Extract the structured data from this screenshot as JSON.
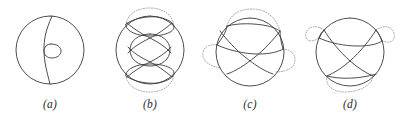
{
  "page": {
    "background_color": "#ffffff",
    "solid_stroke_color": "#3a3a3a",
    "dotted_stroke_color": "#9a9a9a"
  },
  "figures": [
    {
      "label": "(a)",
      "name": "figure-a",
      "description": "circle with a vertical meridian curve and a small loop at the center",
      "center": [
        50,
        50
      ],
      "radius": 34,
      "solid_paths": [
        "M 50 16 A 34 34 0 1 0 50 84 A 34 34 0 1 0 50 16",
        "M 52 16 C 45 32 44 40 44 50 C 44 62 47 72 50 84",
        "M 51 44 C 57 44 61 47 61 51 C 61 55 57 58 52 58 C 47 58 44 55 44 51 C 44 47 47 44 51 44"
      ],
      "dotted_paths": []
    },
    {
      "label": "(b)",
      "name": "figure-b",
      "description": "circle with two lens-shaped arcs top and bottom, a central oval, crossing arcs, and dotted outer caps top and bottom",
      "center": [
        50,
        50
      ],
      "radius": 34,
      "solid_paths": [
        "M 50 16 A 34 34 0 1 0 50 84 A 34 34 0 1 0 50 16",
        "M 26 24 C 34 18 48 16 58 17 C 68 19 74 23 74 27 C 74 32 64 36 50 36 C 36 36 27 31 26 26 Z",
        "M 26 76 C 34 82 48 84 58 83 C 68 81 74 77 74 73 C 74 68 64 64 50 64 C 36 64 27 69 26 74 Z",
        "M 50 34 C 38 34 30 41 30 50 C 30 59 38 66 50 66 C 62 66 70 59 70 50 C 70 41 62 34 50 34 Z",
        "M 27 23 C 35 30 44 35 50 38 C 58 42 66 47 71 53",
        "M 72 23 C 64 30 56 35 50 38 C 42 42 33 47 28 53",
        "M 27 77 C 35 70 44 65 50 62 C 58 58 66 53 71 47",
        "M 72 77 C 64 70 56 65 50 62 C 42 58 33 53 28 47"
      ],
      "dotted_paths": [
        "M 26 25 C 27 14 37 8 50 8 C 63 8 73 15 74 26",
        "M 26 75 C 27 86 37 92 50 92 C 63 92 73 85 74 74"
      ]
    },
    {
      "label": "(c)",
      "name": "figure-c",
      "description": "circle with three arcs crossing in the interior and three dotted outer caps at top, left and right",
      "center": [
        50,
        52
      ],
      "radius": 34,
      "solid_paths": [
        "M 50 18 A 34 34 0 1 0 50 86 A 34 34 0 1 0 50 18",
        "M 27 26 C 38 23 54 23 68 26 C 76 28 80 31 80 31",
        "M 20 31 C 26 39 36 50 45 57 C 55 65 64 71 73 74",
        "M 80 31 C 74 39 64 50 55 57 C 45 65 36 71 27 74",
        "M 17 45 C 28 50 44 54 58 54 C 70 54 78 52 83 49",
        "M 17 45 C 22 38 26 33 27 26",
        "M 83 49 C 81 42 80 36 80 31"
      ],
      "dotted_paths": [
        "M 27 26 C 30 15 39 9 52 9 C 66 9 76 17 80 31",
        "M 17 45 C 9 44 4 47 3 53 C 2 60 8 66 21 68",
        "M 83 49 C 91 50 95 54 95 60 C 95 67 88 72 75 72"
      ]
    },
    {
      "label": "(d)",
      "name": "figure-d",
      "description": "circle with three arcs crossing in the interior and three dotted outer caps at upper-left, upper-right and bottom",
      "center": [
        50,
        52
      ],
      "radius": 34,
      "solid_paths": [
        "M 50 18 A 34 34 0 1 0 50 86 A 34 34 0 1 0 50 18",
        "M 19 38 C 30 43 44 46 58 46 C 70 46 78 44 82 41",
        "M 24 30 C 30 40 40 52 50 61 C 58 68 66 73 73 76",
        "M 76 30 C 70 40 60 52 50 61 C 42 68 34 73 27 76",
        "M 27 76 C 38 79 54 79 68 76 C 73 75 76 74 76 74",
        "M 19 38 C 20 34 22 32 24 30",
        "M 82 41 C 80 36 78 32 76 30"
      ],
      "dotted_paths": [
        "M 24 30 C 16 25 10 26 7 31 C 3 38 8 45 19 38",
        "M 76 30 C 84 25 90 26 93 31 C 97 38 92 45 82 41",
        "M 27 76 C 25 85 32 92 45 92 C 60 92 72 85 73 76"
      ]
    }
  ]
}
